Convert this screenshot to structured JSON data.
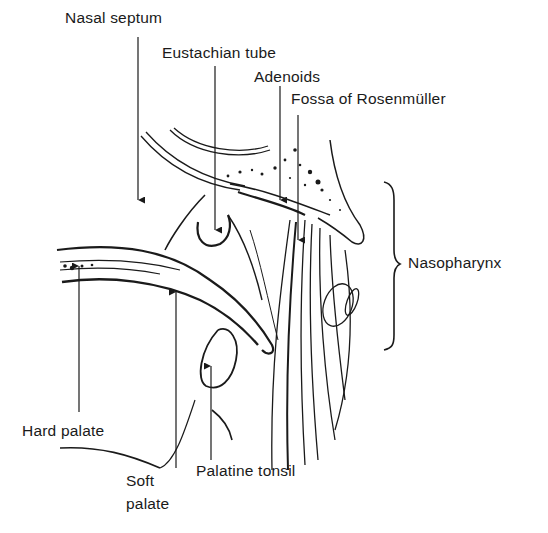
{
  "figure": {
    "type": "anatomical line drawing",
    "colors": {
      "ink": "#1a1a1a",
      "background": "#ffffff"
    }
  },
  "labels": {
    "nasal_septum": "Nasal septum",
    "eustachian_tube": "Eustachian tube",
    "adenoids": "Adenoids",
    "fossa_of_rosenmuller": "Fossa of Rosenmüller",
    "nasopharynx": "Nasopharynx",
    "hard_palate": "Hard palate",
    "soft_palate_line1": "Soft",
    "soft_palate_line2": "palate",
    "palatine_tonsil": "Palatine tonsil"
  }
}
